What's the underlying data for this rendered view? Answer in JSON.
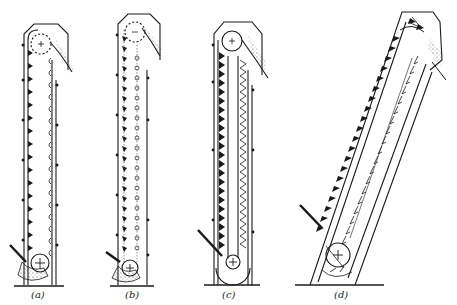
{
  "figure": {
    "type": "bucket elevator types",
    "panels": [
      {
        "id": "a",
        "label": "(a)",
        "description": "Centrifugal-discharge vertical bucket elevator, spaced buckets, boot loading"
      },
      {
        "id": "b",
        "label": "(b)",
        "description": "Positive-discharge vertical elevator with chain-mounted buckets"
      },
      {
        "id": "c",
        "label": "(c)",
        "description": "Continuous-bucket vertical elevator"
      },
      {
        "id": "d",
        "label": "(d)",
        "description": "Inclined continuous-bucket elevator"
      }
    ]
  },
  "colors": {
    "ink": "#1a1a1a",
    "background": "#ffffff"
  }
}
